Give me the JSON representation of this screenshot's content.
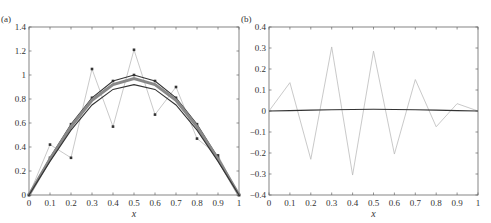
{
  "chart_data": [
    {
      "panel": "(a)",
      "type": "line",
      "title": "",
      "xlabel": "x",
      "ylabel": "",
      "xlim": [
        0,
        1
      ],
      "ylim": [
        0,
        1.4
      ],
      "xticks": [
        0,
        0.1,
        0.2,
        0.3,
        0.4,
        0.5,
        0.6,
        0.7,
        0.8,
        0.9,
        1
      ],
      "yticks": [
        0,
        0.2,
        0.4,
        0.6,
        0.8,
        1,
        1.2,
        1.4
      ],
      "grid": false,
      "x": [
        0,
        0.1,
        0.2,
        0.3,
        0.4,
        0.5,
        0.6,
        0.7,
        0.8,
        0.9,
        1
      ],
      "series": [
        {
          "name": "noisy data",
          "style": "light gray line with markers",
          "values": [
            0,
            0.42,
            0.31,
            1.05,
            0.57,
            1.21,
            0.67,
            0.9,
            0.47,
            0.33,
            0
          ]
        },
        {
          "name": "smoothed (final)",
          "style": "dark line with markers",
          "values": [
            0,
            0.31,
            0.59,
            0.81,
            0.95,
            1.0,
            0.95,
            0.81,
            0.59,
            0.31,
            0
          ]
        },
        {
          "name": "smoothed (iterates)",
          "style": "gray band",
          "values": [
            0,
            0.3,
            0.57,
            0.79,
            0.92,
            0.97,
            0.92,
            0.79,
            0.57,
            0.3,
            0
          ]
        },
        {
          "name": "smoothed (lowest)",
          "style": "dark line",
          "values": [
            0,
            0.28,
            0.54,
            0.75,
            0.88,
            0.92,
            0.88,
            0.75,
            0.54,
            0.28,
            0
          ]
        }
      ]
    },
    {
      "panel": "(b)",
      "type": "line",
      "title": "",
      "xlabel": "x",
      "ylabel": "",
      "xlim": [
        0,
        1
      ],
      "ylim": [
        -0.4,
        0.4
      ],
      "xticks": [
        0,
        0.1,
        0.2,
        0.3,
        0.4,
        0.5,
        0.6,
        0.7,
        0.8,
        0.9,
        1
      ],
      "yticks": [
        -0.4,
        -0.3,
        -0.2,
        -0.1,
        0,
        0.1,
        0.2,
        0.3,
        0.4
      ],
      "grid": false,
      "x": [
        0,
        0.1,
        0.2,
        0.3,
        0.4,
        0.5,
        0.6,
        0.7,
        0.8,
        0.9,
        1
      ],
      "series": [
        {
          "name": "noise",
          "style": "light gray line",
          "values": [
            0,
            0.135,
            -0.23,
            0.305,
            -0.305,
            0.285,
            -0.205,
            0.15,
            -0.075,
            0.035,
            0
          ]
        },
        {
          "name": "residual",
          "style": "dark line",
          "values": [
            0,
            0.002,
            0.004,
            0.006,
            0.007,
            0.008,
            0.007,
            0.006,
            0.004,
            0.002,
            0
          ]
        }
      ]
    }
  ],
  "labels": {
    "panel_a": "(a)",
    "panel_b": "(b)",
    "xlabel": "x"
  }
}
